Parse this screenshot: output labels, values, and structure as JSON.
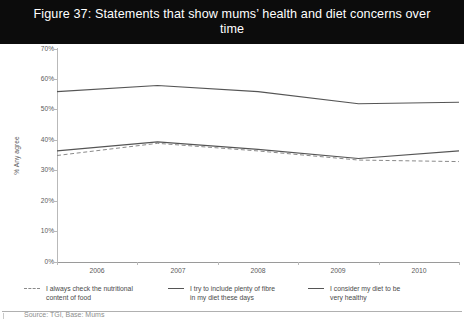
{
  "figure": {
    "title": "Figure 37: Statements that show mums’ health and diet concerns over time",
    "title_line1": "Figure 37: Statements that show mums’ health and diet concerns over",
    "title_line2": "time",
    "title_bar_color": "#0c0c0c",
    "title_text_color": "#ffffff"
  },
  "footer": {
    "source": "Source: TGI, Base: Mums"
  },
  "legend": {
    "position": "bottom",
    "items": [
      {
        "label": "I always check the nutritional\ncontent of food",
        "style": "dashed",
        "color": "#8a8a8a",
        "marker_name": "dashed-line-swatch"
      },
      {
        "label": "I try to include plenty of fibre\nin my diet these days",
        "style": "solid",
        "color": "#555555",
        "marker_name": "solid-line-swatch"
      },
      {
        "label": "I consider my diet to be\nvery healthy",
        "style": "solid",
        "color": "#555555",
        "marker_name": "solid-line-swatch"
      }
    ]
  },
  "axes": {
    "y": {
      "label": "% Any agree",
      "ticks": [
        "0%",
        "10%",
        "20%",
        "30%",
        "40%",
        "50%",
        "60%",
        "70%"
      ],
      "min": 0,
      "max": 70,
      "step": 10
    },
    "x": {
      "label": "",
      "ticks": [
        "2006",
        "2007",
        "2008",
        "2009",
        "2010"
      ]
    }
  },
  "chart_data": {
    "type": "line",
    "title": "Figure 37: Statements that show mums’ health and diet concerns over time",
    "subtitle": "",
    "xlabel": "",
    "ylabel": "% Any agree",
    "categories": [
      "2006",
      "2007",
      "2008",
      "2009",
      "2010"
    ],
    "ylim": [
      0,
      70
    ],
    "ytick_values": [
      0,
      10,
      20,
      30,
      40,
      50,
      60,
      70
    ],
    "ytick_labels": [
      "0%",
      "10%",
      "20%",
      "30%",
      "40%",
      "50%",
      "60%",
      "70%"
    ],
    "grid": false,
    "legend_position": "bottom",
    "series": [
      {
        "name": "I consider my diet to be very healthy",
        "style": "solid",
        "color": "#555555",
        "values": [
          56,
          58,
          56,
          52,
          52.5
        ]
      },
      {
        "name": "I try to include plenty of fibre in my diet these days",
        "style": "solid",
        "color": "#555555",
        "values": [
          36.5,
          39.5,
          37,
          34,
          36.5
        ]
      },
      {
        "name": "I always check the nutritional content of food",
        "style": "dashed",
        "color": "#8a8a8a",
        "values": [
          35,
          39,
          36.5,
          33.5,
          33
        ]
      }
    ]
  }
}
